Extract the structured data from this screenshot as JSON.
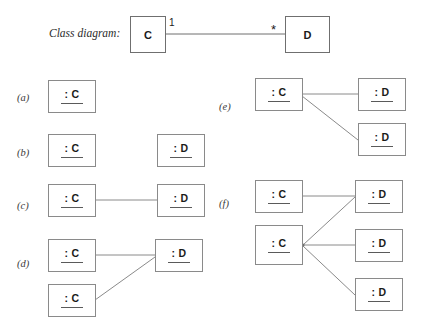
{
  "figure": {
    "caption": "Class diagram:",
    "class_diagram": {
      "source_class": "C",
      "target_class": "D",
      "source_multiplicity": "1",
      "target_multiplicity": "*",
      "line_color": "#6f6f6f",
      "box_border_color": "#6f6f6f",
      "text_color": "#1a1a1a"
    },
    "options": [
      {
        "label": "(a)",
        "c_instances": [
          "C"
        ],
        "d_instances": [],
        "links": 0
      },
      {
        "label": "(b)",
        "c_instances": [
          "C"
        ],
        "d_instances": [
          "D"
        ],
        "links": 0
      },
      {
        "label": "(c)",
        "c_instances": [
          "C"
        ],
        "d_instances": [
          "D"
        ],
        "links": 1
      },
      {
        "label": "(d)",
        "c_instances": [
          "C",
          "C"
        ],
        "d_instances": [
          "D"
        ],
        "links": 2
      },
      {
        "label": "(e)",
        "c_instances": [
          "C"
        ],
        "d_instances": [
          "D",
          "D"
        ],
        "links": 2
      },
      {
        "label": "(f)",
        "c_instances": [
          "C",
          "C"
        ],
        "d_instances": [
          "D",
          "D",
          "D"
        ],
        "links": 4
      }
    ],
    "object_labels": {
      "c_object": ": C",
      "d_object": ": D"
    },
    "colors": {
      "background": "#ffffff",
      "object_border": "#8a8a8a",
      "link_line": "#8a8a8a",
      "underline": "#5a5a5a"
    }
  }
}
